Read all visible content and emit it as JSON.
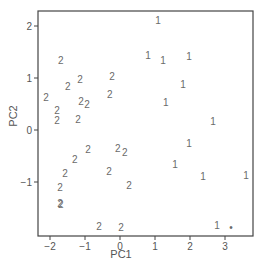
{
  "chart_data": {
    "type": "scatter",
    "title": "",
    "xlabel": "PC1",
    "ylabel": "PC2",
    "xlim": [
      -2.34,
      3.8
    ],
    "ylim": [
      -2.04,
      2.29
    ],
    "grid": false,
    "legend": null,
    "marker_style": "text labels (class number)",
    "x_ticks": [
      -2,
      -1,
      0,
      1,
      2,
      3
    ],
    "x_tick_labels": [
      "-2",
      "-1",
      "0",
      "1",
      "2",
      "3"
    ],
    "y_ticks": [
      -1,
      0,
      1,
      2
    ],
    "y_tick_labels": [
      "-1",
      "0",
      "1",
      "2"
    ],
    "series": [
      {
        "name": "1",
        "label": "1",
        "points": [
          {
            "x": 1.09,
            "y": 2.1
          },
          {
            "x": 0.8,
            "y": 1.44
          },
          {
            "x": 1.23,
            "y": 1.33
          },
          {
            "x": 1.97,
            "y": 1.42
          },
          {
            "x": 1.8,
            "y": 0.88
          },
          {
            "x": 1.31,
            "y": 0.52
          },
          {
            "x": 2.66,
            "y": 0.17
          },
          {
            "x": 1.97,
            "y": -0.25
          },
          {
            "x": 1.57,
            "y": -0.67
          },
          {
            "x": 2.37,
            "y": -0.9
          },
          {
            "x": 3.6,
            "y": -0.88
          },
          {
            "x": 2.77,
            "y": -1.83
          }
        ]
      },
      {
        "name": "2",
        "label": "2",
        "points": [
          {
            "x": -1.69,
            "y": 1.33
          },
          {
            "x": -1.14,
            "y": 0.98
          },
          {
            "x": -0.23,
            "y": 1.02
          },
          {
            "x": -1.49,
            "y": 0.83
          },
          {
            "x": -2.11,
            "y": 0.62
          },
          {
            "x": -0.29,
            "y": 0.69
          },
          {
            "x": -1.11,
            "y": 0.54
          },
          {
            "x": -0.94,
            "y": 0.5
          },
          {
            "x": -1.8,
            "y": 0.37
          },
          {
            "x": -1.8,
            "y": 0.19
          },
          {
            "x": -1.2,
            "y": 0.21
          },
          {
            "x": -0.91,
            "y": -0.37
          },
          {
            "x": -0.06,
            "y": -0.35
          },
          {
            "x": 0.14,
            "y": -0.44
          },
          {
            "x": -1.29,
            "y": -0.56
          },
          {
            "x": -1.57,
            "y": -0.83
          },
          {
            "x": -0.31,
            "y": -0.79
          },
          {
            "x": 0.26,
            "y": -1.06
          },
          {
            "x": -1.71,
            "y": -1.1
          },
          {
            "x": -1.71,
            "y": -1.42
          },
          {
            "x": -1.69,
            "y": -1.44
          },
          {
            "x": -0.6,
            "y": -1.85
          },
          {
            "x": 0.03,
            "y": -1.88
          }
        ]
      },
      {
        "name": "dot",
        "label": "•",
        "points": [
          {
            "x": 3.17,
            "y": -1.88
          }
        ]
      }
    ]
  },
  "plot": {
    "left_px": 38,
    "top_px": 11,
    "right_px": 253,
    "bottom_px": 236,
    "x0_px": 120,
    "x_unit_px": 35,
    "y0_px": 130,
    "y_unit_px": 52,
    "frame_color": "#444444",
    "text_color": "#6a6a6a"
  }
}
